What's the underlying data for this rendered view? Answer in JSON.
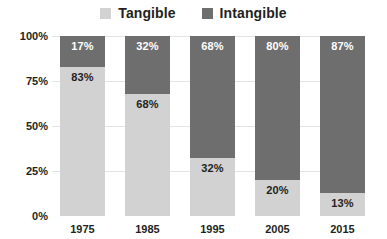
{
  "chart_data": {
    "type": "bar",
    "subtype": "stacked-percentage",
    "title": "",
    "subtitle": "",
    "xlabel": "",
    "ylabel": "",
    "ylim": [
      0,
      100
    ],
    "yticks": [
      "0%",
      "25%",
      "50%",
      "75%",
      "100%"
    ],
    "ytick_values": [
      0,
      25,
      50,
      75,
      100
    ],
    "grid": true,
    "legend_position": "top-center",
    "categories": [
      "1975",
      "1985",
      "1995",
      "2005",
      "2015"
    ],
    "series": [
      {
        "name": "Tangible",
        "color": "#d2d2d2",
        "values": [
          83,
          68,
          32,
          20,
          13
        ],
        "labels": [
          "83%",
          "68%",
          "32%",
          "20%",
          "13%"
        ],
        "label_color": "#231f20"
      },
      {
        "name": "Intangible",
        "color": "#6e6e6e",
        "values": [
          17,
          32,
          68,
          80,
          87
        ],
        "labels": [
          "17%",
          "32%",
          "68%",
          "80%",
          "87%"
        ],
        "label_color": "#ffffff"
      }
    ]
  },
  "legend": {
    "items": [
      {
        "label": "Tangible",
        "color": "#d2d2d2"
      },
      {
        "label": "Intangible",
        "color": "#6e6e6e"
      }
    ]
  },
  "axes": {
    "y": {
      "ticks": [
        {
          "label": "100%"
        },
        {
          "label": "75%"
        },
        {
          "label": "50%"
        },
        {
          "label": "25%"
        },
        {
          "label": "0%"
        }
      ]
    },
    "x": {
      "ticks": [
        {
          "label": "1975"
        },
        {
          "label": "1985"
        },
        {
          "label": "1995"
        },
        {
          "label": "2005"
        },
        {
          "label": "2015"
        }
      ]
    }
  },
  "bars": [
    {
      "category": "1975",
      "top": {
        "series": "Intangible",
        "value": 17,
        "label": "17%"
      },
      "bottom": {
        "series": "Tangible",
        "value": 83,
        "label": "83%"
      }
    },
    {
      "category": "1985",
      "top": {
        "series": "Intangible",
        "value": 32,
        "label": "32%"
      },
      "bottom": {
        "series": "Tangible",
        "value": 68,
        "label": "68%"
      }
    },
    {
      "category": "1995",
      "top": {
        "series": "Intangible",
        "value": 68,
        "label": "68%"
      },
      "bottom": {
        "series": "Tangible",
        "value": 32,
        "label": "32%"
      }
    },
    {
      "category": "2005",
      "top": {
        "series": "Intangible",
        "value": 80,
        "label": "80%"
      },
      "bottom": {
        "series": "Tangible",
        "value": 20,
        "label": "20%"
      }
    },
    {
      "category": "2015",
      "top": {
        "series": "Intangible",
        "value": 87,
        "label": "87%"
      },
      "bottom": {
        "series": "Tangible",
        "value": 13,
        "label": "13%"
      }
    }
  ],
  "colors": {
    "tangible": "#d2d2d2",
    "intangible": "#6e6e6e",
    "gridline": "#e3e3e3",
    "text": "#231f20",
    "background": "#ffffff"
  }
}
